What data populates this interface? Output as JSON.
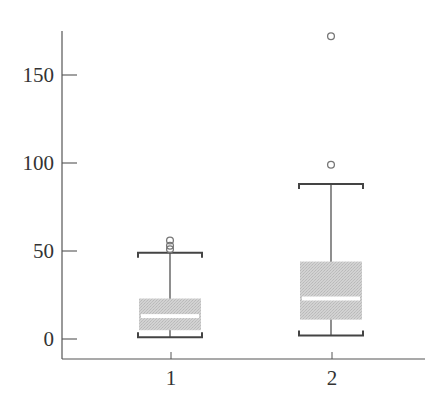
{
  "chart_data": {
    "type": "box",
    "title": "",
    "xlabel": "",
    "ylabel": "",
    "categories": [
      "1",
      "2"
    ],
    "ylim": [
      -12,
      175
    ],
    "yticks": [
      0,
      50,
      100,
      150
    ],
    "ytick_labels": [
      "0",
      "50",
      "100",
      "150"
    ],
    "xtick_labels": [
      "1",
      "2"
    ],
    "grid": false,
    "legend": null,
    "series": [
      {
        "name": "1",
        "whisker_low": 1,
        "q1": 5,
        "median": 13,
        "q3": 23,
        "whisker_high": 49,
        "outliers": [
          51,
          53,
          56
        ]
      },
      {
        "name": "2",
        "whisker_low": 2,
        "q1": 11,
        "median": 23,
        "q3": 44,
        "whisker_high": 88,
        "outliers": [
          99,
          172
        ]
      }
    ]
  },
  "style": {
    "axis_color": "#555555",
    "whisker_color": "#444444",
    "box_fill": "#c9c9c9",
    "median_color": "#ffffff",
    "outlier_stroke": "#777777",
    "background": "#ffffff"
  }
}
